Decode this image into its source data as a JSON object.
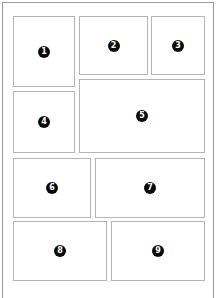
{
  "diagram": {
    "type": "page-panel-layout",
    "panels": [
      {
        "number": "1"
      },
      {
        "number": "2"
      },
      {
        "number": "3"
      },
      {
        "number": "4"
      },
      {
        "number": "5"
      },
      {
        "number": "6"
      },
      {
        "number": "7"
      },
      {
        "number": "8"
      },
      {
        "number": "9"
      }
    ]
  }
}
